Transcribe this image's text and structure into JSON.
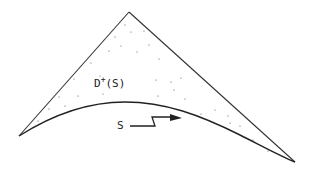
{
  "diagram": {
    "type": "spacetime-domain-of-dependence",
    "labels": {
      "region": "D",
      "region_sup": "+",
      "region_arg": "(S)",
      "surface": "S"
    },
    "colors": {
      "line": "#333333",
      "dots": "#555555",
      "background": "#ffffff"
    },
    "vertices": {
      "apex": [
        129,
        12
      ],
      "left": [
        19,
        136
      ],
      "right": [
        295,
        162
      ]
    }
  }
}
